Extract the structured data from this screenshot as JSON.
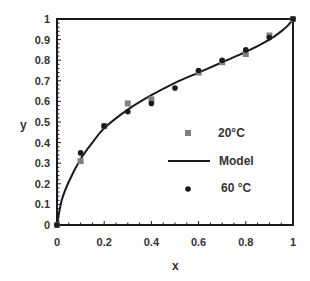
{
  "chart_data": {
    "type": "scatter",
    "title": "",
    "xlabel": "x",
    "ylabel": "y",
    "xlim": [
      0,
      1
    ],
    "ylim": [
      0,
      1
    ],
    "xticks": [
      "0",
      "0.2",
      "0.4",
      "0.6",
      "0.8",
      "1"
    ],
    "yticks": [
      "0",
      "0.1",
      "0.2",
      "0.3",
      "0.4",
      "0.5",
      "0.6",
      "0.7",
      "0.8",
      "0.9",
      "1"
    ],
    "grid": false,
    "legend_position": "inside-lower-right",
    "series": [
      {
        "name": "20°C",
        "marker": "square",
        "color": "#808080",
        "x": [
          0,
          0.1,
          0.2,
          0.3,
          0.4,
          0.6,
          0.7,
          0.8,
          0.9,
          1
        ],
        "y": [
          0,
          0.31,
          0.48,
          0.59,
          0.61,
          0.74,
          0.79,
          0.83,
          0.92,
          1.0
        ]
      },
      {
        "name": "Model",
        "marker": "line",
        "color": "#1a1a1a",
        "x": [
          0,
          0.02,
          0.05,
          0.1,
          0.15,
          0.2,
          0.3,
          0.4,
          0.5,
          0.6,
          0.7,
          0.8,
          0.9,
          0.95,
          0.98,
          1
        ],
        "y": [
          0,
          0.12,
          0.21,
          0.32,
          0.4,
          0.47,
          0.56,
          0.63,
          0.69,
          0.74,
          0.79,
          0.84,
          0.9,
          0.94,
          0.97,
          1.0
        ]
      },
      {
        "name": "60 °C",
        "marker": "circle",
        "color": "#1a1a1a",
        "x": [
          0,
          0.1,
          0.2,
          0.3,
          0.4,
          0.5,
          0.6,
          0.7,
          0.8,
          0.9,
          1
        ],
        "y": [
          0,
          0.35,
          0.48,
          0.55,
          0.59,
          0.665,
          0.75,
          0.8,
          0.85,
          0.91,
          1.0
        ]
      }
    ]
  },
  "legend": {
    "item1": "20°C",
    "item2": "Model",
    "item3": "60 °C"
  },
  "axes": {
    "xlabel": "x",
    "ylabel": "y"
  }
}
